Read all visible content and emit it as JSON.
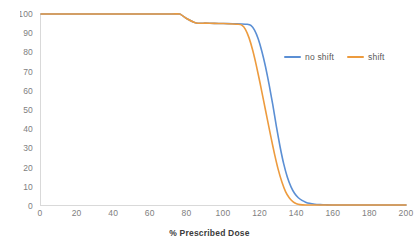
{
  "chart_data": {
    "type": "line",
    "title": "",
    "subtitle": "",
    "xlabel": "% Prescribed Dose",
    "ylabel": "",
    "xlim": [
      0,
      200
    ],
    "ylim": [
      0,
      100
    ],
    "xticks": [
      0,
      20,
      40,
      60,
      80,
      100,
      120,
      140,
      160,
      180,
      200
    ],
    "yticks": [
      0,
      10,
      20,
      30,
      40,
      50,
      60,
      70,
      80,
      90,
      100
    ],
    "ytick_labels": [
      "0",
      "10",
      "20",
      "30",
      "40",
      "50",
      "60",
      "70",
      "80",
      "90",
      "100"
    ],
    "xtick_labels": [
      "0",
      "20",
      "40",
      "60",
      "80",
      "100",
      "120",
      "140",
      "160",
      "180",
      "200"
    ],
    "grid": false,
    "legend_position": "upper right inside",
    "annotations": [],
    "series": [
      {
        "name": "no shift",
        "color": "#5B8FD4",
        "points": [
          [
            0,
            100
          ],
          [
            10,
            100
          ],
          [
            20,
            100
          ],
          [
            30,
            100
          ],
          [
            40,
            100
          ],
          [
            50,
            100
          ],
          [
            60,
            100
          ],
          [
            70,
            100
          ],
          [
            76,
            100
          ],
          [
            80,
            97.5
          ],
          [
            85,
            95.3
          ],
          [
            90,
            95.2
          ],
          [
            95,
            95.1
          ],
          [
            100,
            95.0
          ],
          [
            105,
            94.9
          ],
          [
            110,
            94.8
          ],
          [
            113,
            94.6
          ],
          [
            115,
            94.0
          ],
          [
            117,
            91.5
          ],
          [
            119,
            87.0
          ],
          [
            121,
            80.5
          ],
          [
            123,
            72.5
          ],
          [
            125,
            63.0
          ],
          [
            127,
            52.5
          ],
          [
            129,
            41.0
          ],
          [
            131,
            30.5
          ],
          [
            133,
            21.5
          ],
          [
            135,
            14.5
          ],
          [
            137,
            9.5
          ],
          [
            139,
            6.0
          ],
          [
            141,
            3.8
          ],
          [
            143,
            2.4
          ],
          [
            145,
            1.5
          ],
          [
            147,
            0.9
          ],
          [
            150,
            0.4
          ],
          [
            153,
            0.2
          ],
          [
            156,
            0.1
          ],
          [
            160,
            0
          ],
          [
            170,
            0
          ],
          [
            180,
            0
          ],
          [
            190,
            0
          ],
          [
            200,
            0
          ]
        ]
      },
      {
        "name": "shift",
        "color": "#ED9B3E",
        "points": [
          [
            0,
            100
          ],
          [
            10,
            100
          ],
          [
            20,
            100
          ],
          [
            30,
            100
          ],
          [
            40,
            100
          ],
          [
            50,
            100
          ],
          [
            60,
            100
          ],
          [
            70,
            100
          ],
          [
            76,
            100
          ],
          [
            80,
            97.5
          ],
          [
            85,
            95.3
          ],
          [
            90,
            95.2
          ],
          [
            95,
            95.1
          ],
          [
            100,
            95.0
          ],
          [
            105,
            94.8
          ],
          [
            108,
            94.6
          ],
          [
            110,
            94.2
          ],
          [
            112,
            92.0
          ],
          [
            114,
            87.5
          ],
          [
            116,
            81.0
          ],
          [
            118,
            73.0
          ],
          [
            120,
            64.0
          ],
          [
            122,
            54.5
          ],
          [
            124,
            45.0
          ],
          [
            126,
            35.5
          ],
          [
            128,
            26.5
          ],
          [
            130,
            18.5
          ],
          [
            132,
            12.0
          ],
          [
            134,
            7.0
          ],
          [
            136,
            3.8
          ],
          [
            138,
            1.8
          ],
          [
            140,
            0.7
          ],
          [
            142,
            0.2
          ],
          [
            145,
            0
          ],
          [
            150,
            0
          ],
          [
            160,
            0
          ],
          [
            170,
            0
          ],
          [
            180,
            0
          ],
          [
            190,
            0
          ],
          [
            200,
            0
          ]
        ]
      }
    ],
    "legend": [
      {
        "label": "no shift",
        "color": "#5B8FD4"
      },
      {
        "label": "shift",
        "color": "#ED9B3E"
      }
    ]
  }
}
